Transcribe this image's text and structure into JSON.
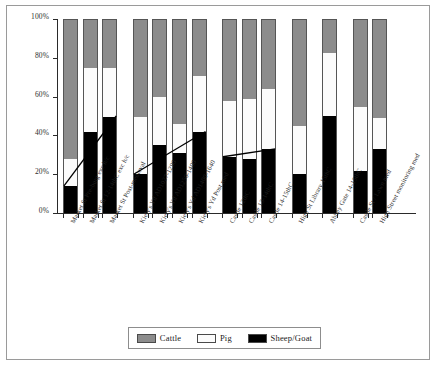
{
  "chart_data": {
    "type": "bar",
    "title": "",
    "subtitle": "",
    "xlabel": "",
    "ylabel": "",
    "stacked": true,
    "normalized_percent": true,
    "grid": false,
    "legend_position": "bottom",
    "ylim": [
      0,
      100
    ],
    "ytick_labels": [
      "0%",
      "20%",
      "40%",
      "60%",
      "80%",
      "100%"
    ],
    "ytick_values": [
      0,
      20,
      40,
      60,
      80,
      100
    ],
    "categories": [
      "Market St Pre-burg exc h/c",
      "Market St 12-14thC exc h/c",
      "Market St Post-medieval",
      "Kiely's Yd AD1027-1290",
      "Kiely's Yd AD1250-1400",
      "Kiely's Yd AD1400-1640",
      "Kiely's Yd Post med",
      "Castle 12thC",
      "Castle 13-14thC",
      "Castle 14-15thC",
      "High St Library 15thC",
      "Abbey Gate 14-15thC",
      "Castle St / Lawn med",
      "High Street monitoring med"
    ],
    "series": [
      {
        "name": "Cattle",
        "color": "#8c8c8c",
        "values": [
          72,
          25,
          25,
          50,
          40,
          54,
          29,
          42,
          41,
          36,
          55,
          17,
          45,
          51
        ]
      },
      {
        "name": "Pig",
        "color": "#fbfbfb",
        "values": [
          14,
          33,
          25,
          30,
          25,
          15,
          29,
          29,
          31,
          31,
          25,
          33,
          33,
          16
        ]
      },
      {
        "name": "Sheep/Goat",
        "color": "#000000",
        "values": [
          14,
          42,
          50,
          20,
          35,
          31,
          42,
          29,
          28,
          33,
          20,
          50,
          22,
          33
        ]
      }
    ],
    "trend_lines": [
      {
        "name": "sheep-goat-trend-market-st",
        "from_bar": 1,
        "to_bar": 3,
        "from_value": 14,
        "to_value": 50
      },
      {
        "name": "sheep-goat-trend-kielys-yd",
        "from_bar": 4,
        "to_bar": 7,
        "from_value": 20,
        "to_value": 42
      },
      {
        "name": "sheep-goat-trend-castle",
        "from_bar": 8,
        "to_bar": 10,
        "from_value": 29,
        "to_value": 33
      }
    ],
    "group_breaks_after_bars": [
      3,
      7,
      10,
      11,
      12
    ]
  },
  "legend": {
    "items": [
      {
        "label": "Cattle",
        "swatch": "cattle-swatch"
      },
      {
        "label": "Pig",
        "swatch": "pig-swatch"
      },
      {
        "label": "Sheep/Goat",
        "swatch": "sheep-goat-swatch"
      }
    ]
  }
}
